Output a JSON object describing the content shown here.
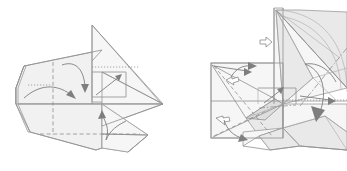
{
  "figure": {
    "background_color": "#ffffff",
    "paper_fill": "#f1f1f1",
    "paper_fill_shaded": "#e4e4e4",
    "line_color": "#8f8f8f",
    "arrow_color": "#7e7e7e",
    "panels": [
      {
        "id": "panel-left",
        "label": "",
        "step_number": "",
        "arrows": [
          {
            "name": "fold-arrow-top",
            "type": "solid-curved",
            "direction": "down"
          },
          {
            "name": "fold-arrow-left",
            "type": "solid-curved",
            "direction": "right"
          },
          {
            "name": "fold-arrow-inner",
            "type": "solid-straight",
            "direction": "up-right"
          },
          {
            "name": "fold-arrow-bottom",
            "type": "solid-curved",
            "direction": "up"
          }
        ],
        "crease_types": [
          "valley",
          "mountain",
          "edge"
        ]
      },
      {
        "id": "panel-right",
        "label": "",
        "step_number": "",
        "arrows": [
          {
            "name": "push-arrow-left-upper",
            "type": "hollow",
            "direction": "left"
          },
          {
            "name": "push-arrow-left-lower",
            "type": "hollow",
            "direction": "left"
          },
          {
            "name": "push-arrow-center",
            "type": "hollow",
            "direction": "right"
          },
          {
            "name": "fold-arrow-large-right",
            "type": "solid-curved",
            "direction": "down"
          },
          {
            "name": "fold-arrow-inner-small",
            "type": "solid-straight",
            "direction": "up-right"
          },
          {
            "name": "rotate-arc-top",
            "type": "arc",
            "direction": "clockwise"
          }
        ],
        "crease_types": [
          "valley",
          "mountain",
          "dash-dot",
          "edge"
        ]
      }
    ]
  }
}
